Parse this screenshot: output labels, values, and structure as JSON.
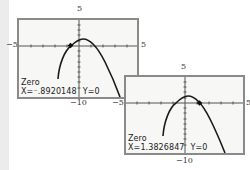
{
  "window": {
    "xmin": -5,
    "xmax": 5,
    "ymin": -10,
    "ymax": 5
  },
  "screens": [
    {
      "id": "screen-1",
      "labels": {
        "ymax": "5",
        "xmin": "−5",
        "xmax": "5",
        "ymin": "−10"
      },
      "readout": {
        "title": "Zero",
        "x_text": "X=⁻.8920148",
        "y_text": "Y=0"
      },
      "zero_x": -0.8920148
    },
    {
      "id": "screen-2",
      "labels": {
        "ymax": "5",
        "xmin": "−5",
        "xmax": "5",
        "ymin": "−10"
      },
      "readout": {
        "title": "Zero",
        "x_text": "X=1.3826847",
        "y_text": "Y=0"
      },
      "zero_x": 1.3826847
    }
  ],
  "colors": {
    "frame": "#8a8a8a",
    "screen_bg": "#f7f7f5",
    "curve": "#1a1a1a",
    "axis": "#555555"
  }
}
